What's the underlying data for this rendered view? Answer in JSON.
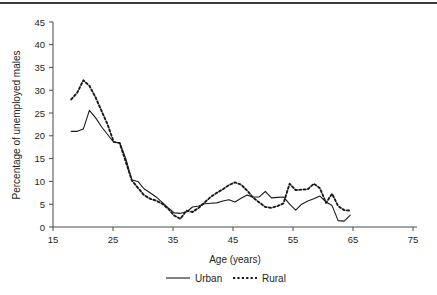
{
  "chart_data": {
    "type": "line",
    "title": "",
    "xlabel": "Age (years)",
    "ylabel": "Percentage of unemployed males",
    "xlim": [
      15,
      75
    ],
    "ylim": [
      0,
      45
    ],
    "xticks": [
      15,
      25,
      35,
      45,
      55,
      65,
      75
    ],
    "yticks": [
      0,
      5,
      10,
      15,
      20,
      25,
      30,
      35,
      40,
      45
    ],
    "grid": false,
    "legend_position": "below-axis",
    "series": [
      {
        "name": "Urban",
        "style": "solid",
        "color": "#1a1a1a",
        "x": [
          18,
          19,
          20,
          21,
          22,
          23,
          24,
          25,
          26,
          27,
          28,
          29,
          30,
          31,
          32,
          33,
          34,
          35,
          36,
          37,
          38,
          39,
          40,
          41,
          42,
          43,
          44,
          45,
          46,
          47,
          48,
          49,
          50,
          51,
          52,
          53,
          54,
          55,
          56,
          57,
          58,
          59,
          60,
          61,
          62,
          63,
          64
        ],
        "y": [
          21.0,
          21.0,
          21.5,
          25.6,
          24.0,
          22.0,
          20.3,
          18.6,
          18.5,
          15.0,
          10.3,
          10.0,
          8.4,
          7.5,
          6.6,
          5.4,
          4.2,
          3.1,
          3.0,
          3.3,
          4.4,
          4.6,
          5.1,
          5.2,
          5.3,
          5.7,
          6.0,
          5.5,
          6.3,
          7.0,
          6.6,
          6.6,
          7.8,
          6.4,
          6.5,
          6.6,
          5.0,
          3.7,
          5.0,
          5.7,
          6.2,
          6.8,
          5.5,
          4.7,
          1.4,
          1.3,
          2.6
        ]
      },
      {
        "name": "Rural",
        "style": "dotted",
        "color": "#1a1a1a",
        "x": [
          18,
          19,
          20,
          21,
          22,
          23,
          24,
          25,
          26,
          27,
          28,
          29,
          30,
          31,
          32,
          33,
          34,
          35,
          36,
          37,
          38,
          39,
          40,
          41,
          42,
          43,
          44,
          45,
          46,
          47,
          48,
          49,
          50,
          51,
          52,
          53,
          54,
          55,
          56,
          57,
          58,
          59,
          60,
          61,
          62,
          63,
          64
        ],
        "y": [
          28.0,
          29.5,
          32.2,
          31.0,
          28.5,
          25.5,
          22.5,
          18.7,
          18.4,
          14.3,
          10.2,
          8.6,
          7.0,
          6.2,
          5.8,
          5.1,
          4.0,
          2.5,
          1.8,
          3.6,
          3.3,
          4.2,
          5.4,
          6.6,
          7.5,
          8.3,
          9.2,
          9.8,
          9.3,
          8.0,
          6.4,
          5.4,
          4.4,
          4.2,
          4.6,
          5.2,
          9.5,
          8.1,
          8.2,
          8.3,
          9.5,
          8.5,
          5.3,
          7.3,
          4.6,
          3.7,
          3.6
        ]
      }
    ],
    "annotations": []
  },
  "legend": {
    "items": [
      {
        "label": "Urban",
        "style": "solid"
      },
      {
        "label": "Rural",
        "style": "dotted"
      }
    ]
  }
}
